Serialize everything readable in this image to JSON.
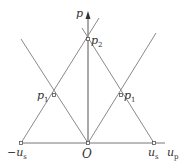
{
  "diagram": {
    "type": "p-u characteristic diagram",
    "axes": {
      "vertical_label": "p",
      "horizontal_label": "u",
      "horizontal_label_sub": "p"
    },
    "points": {
      "origin": {
        "label": "O"
      },
      "neg_us": {
        "label": "−u",
        "sub": "s"
      },
      "pos_us": {
        "label": "u",
        "sub": "s"
      },
      "p1_left": {
        "label": "p",
        "sub": "1"
      },
      "p1_right": {
        "label": "p",
        "sub": "1"
      },
      "p2": {
        "label": "p",
        "sub": "2"
      }
    },
    "colors": {
      "line": "#8a8a8a",
      "axis": "#555555",
      "text": "#333333"
    }
  }
}
